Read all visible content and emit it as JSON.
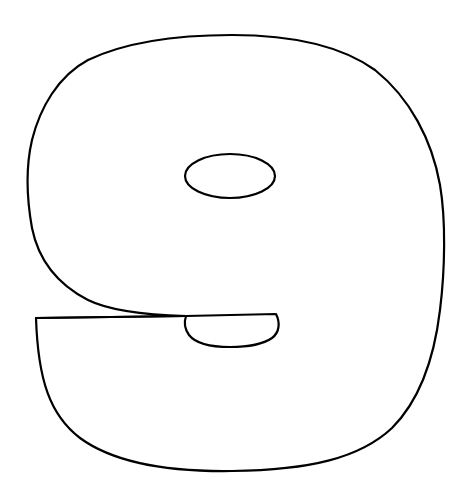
{
  "figure": {
    "glyph": "9",
    "stroke_color": "#000000",
    "fill_color": "#ffffff",
    "background_color": "#ffffff"
  }
}
